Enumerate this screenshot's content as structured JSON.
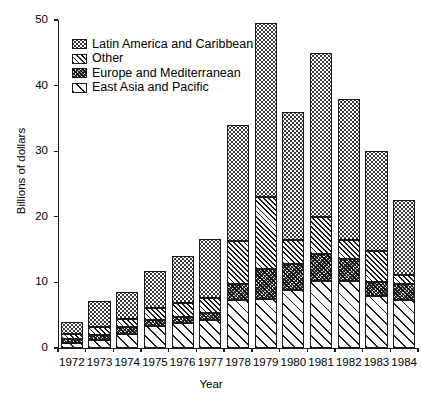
{
  "chart_data": {
    "type": "bar",
    "stacked": true,
    "title": "",
    "xlabel": "Year",
    "ylabel": "Billions of dollars",
    "ylim": [
      0,
      50
    ],
    "yticks": [
      0,
      10,
      20,
      30,
      40,
      50
    ],
    "grid": false,
    "legend_position": "top-left",
    "categories": [
      "1972",
      "1973",
      "1974",
      "1975",
      "1976",
      "1977",
      "1978",
      "1979",
      "1980",
      "1981",
      "1982",
      "1983",
      "1984"
    ],
    "series": [
      {
        "name": "East Asia and Pacific",
        "pattern": "diagonal-hatch-wide",
        "values": [
          0.8,
          1.2,
          2.2,
          3.3,
          3.8,
          4.3,
          7.3,
          7.5,
          8.8,
          10.2,
          10.2,
          8.0,
          7.3
        ]
      },
      {
        "name": "Europe and Mediterranean",
        "pattern": "dark-noise",
        "values": [
          0.5,
          0.8,
          1.0,
          0.9,
          1.0,
          1.1,
          2.4,
          4.5,
          4.0,
          4.2,
          3.3,
          2.0,
          2.4
        ]
      },
      {
        "name": "Other",
        "pattern": "diagonal-hatch-dense",
        "values": [
          0.9,
          1.2,
          1.2,
          1.9,
          2.0,
          2.2,
          6.6,
          11.0,
          3.7,
          5.6,
          3.0,
          4.8,
          1.4
        ]
      },
      {
        "name": "Latin America and Caribbean",
        "pattern": "dots",
        "values": [
          1.8,
          4.0,
          4.1,
          5.6,
          7.3,
          9.0,
          17.7,
          26.5,
          19.5,
          25.0,
          21.5,
          15.2,
          11.5
        ]
      }
    ],
    "totals": [
      4.0,
      7.2,
      8.5,
      11.7,
      14.1,
      16.6,
      34.0,
      49.5,
      36.0,
      45.0,
      38.0,
      30.0,
      22.6
    ],
    "annotations": []
  },
  "legend": {
    "items": [
      {
        "label": "Latin America and Caribbean",
        "swatch": "dots"
      },
      {
        "label": "Other",
        "swatch": "diagonal-hatch-dense"
      },
      {
        "label": "Europe and Mediterranean",
        "swatch": "dark-noise"
      },
      {
        "label": "East Asia and Pacific",
        "swatch": "diagonal-hatch-wide"
      }
    ]
  }
}
